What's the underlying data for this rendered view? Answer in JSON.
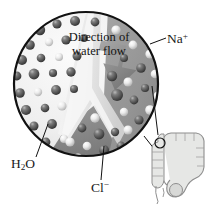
{
  "figure": {
    "labels": {
      "flow_line1": "Direction of",
      "flow_line2": "water flow",
      "sodium": "Na",
      "sodium_charge": "+",
      "water": "H",
      "water_sub": "2",
      "water_tail": "O",
      "chloride": "Cl",
      "chloride_charge": "−"
    },
    "colors": {
      "outline": "#111111",
      "lumen_background": "#f2f2f2",
      "tissue_background": "#9a9a9a",
      "tissue_background_dark": "#848484",
      "membrane": "#ededed",
      "arrow": "#8d8d8d",
      "sphere_dark": "#565656",
      "sphere_light": "#e8e8e8",
      "colon_fill": "#e3e4e2",
      "colon_outline": "#8f8f8f",
      "leader_line": "#111111",
      "text": "#1a1a1a"
    },
    "inset": {
      "name": "large-intestine-diagram",
      "marker": "magnification-circle"
    },
    "regions": {
      "left": "lumen with water molecules",
      "right": "epithelial tissue with sodium and chloride ions",
      "divider": "Y-shaped cell junction / membrane"
    }
  }
}
